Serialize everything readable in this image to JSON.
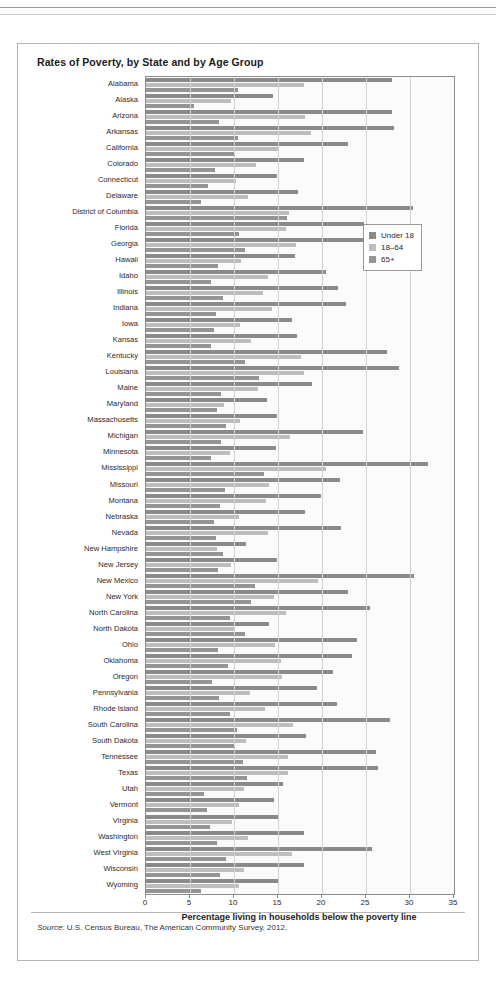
{
  "figure": {
    "title": "Rates of Poverty, by State and by Age Group",
    "source_label": "Source:",
    "source_text": "U.S. Census Bureau, The American Community Survey, 2012."
  },
  "legend": {
    "position": "inside-top-right",
    "items": [
      {
        "label": "Under 18",
        "color": "#8a8a8a"
      },
      {
        "label": "18–64",
        "color": "#bdbdbd"
      },
      {
        "label": "65+",
        "color": "#949494"
      }
    ]
  },
  "chart_data": {
    "type": "bar",
    "orientation": "horizontal",
    "title": "Rates of Poverty, by State and by Age Group",
    "xlabel": "Percentage living in households below the poverty line",
    "ylabel": "",
    "xlim": [
      0,
      35
    ],
    "xticks": [
      0,
      5,
      10,
      15,
      20,
      25,
      30,
      35
    ],
    "grid": "vertical",
    "legend_position": "inside-top-right",
    "categories": [
      "Alabama",
      "Alaska",
      "Arizona",
      "Arkansas",
      "California",
      "Colorado",
      "Connecticut",
      "Delaware",
      "District of Columbia",
      "Florida",
      "Georgia",
      "Hawaii",
      "Idaho",
      "Illinois",
      "Indiana",
      "Iowa",
      "Kansas",
      "Kentucky",
      "Louisiana",
      "Maine",
      "Maryland",
      "Massachusetts",
      "Michigan",
      "Minnesota",
      "Mississippi",
      "Missouri",
      "Montana",
      "Nebraska",
      "Nevada",
      "New Hampshire",
      "New Jersey",
      "New Mexico",
      "New York",
      "North Carolina",
      "North Dakota",
      "Ohio",
      "Oklahoma",
      "Oregon",
      "Pennsylvania",
      "Rhode Island",
      "South Carolina",
      "South Dakota",
      "Tennessee",
      "Texas",
      "Utah",
      "Vermont",
      "Virginia",
      "Washington",
      "West Virginia",
      "Wisconsin",
      "Wyoming"
    ],
    "series": [
      {
        "name": "Under 18",
        "color": "#8a8a8a",
        "values": [
          28.0,
          14.4,
          27.9,
          28.2,
          23.0,
          17.9,
          14.9,
          17.3,
          30.3,
          24.8,
          26.4,
          16.9,
          20.5,
          21.8,
          22.7,
          16.6,
          17.2,
          27.4,
          28.8,
          18.9,
          13.7,
          14.9,
          24.7,
          14.8,
          32.0,
          22.1,
          19.9,
          18.1,
          22.2,
          11.4,
          14.9,
          30.5,
          22.9,
          25.4,
          14.0,
          24.0,
          23.4,
          21.2,
          19.4,
          21.7,
          27.7,
          18.2,
          26.1,
          26.4,
          15.6,
          14.5,
          15.0,
          18.0,
          25.7,
          17.9,
          15.1
        ]
      },
      {
        "name": "18–64",
        "color": "#bdbdbd",
        "values": [
          18.0,
          9.7,
          18.1,
          18.8,
          15.1,
          12.5,
          10.2,
          11.6,
          16.2,
          15.9,
          17.0,
          10.8,
          13.9,
          13.3,
          14.3,
          10.7,
          11.9,
          17.6,
          17.9,
          12.7,
          8.9,
          10.7,
          16.4,
          9.5,
          20.5,
          14.0,
          13.6,
          10.6,
          13.9,
          8.1,
          9.7,
          19.6,
          14.6,
          15.9,
          10.1,
          14.7,
          15.3,
          15.5,
          11.8,
          13.5,
          16.7,
          11.4,
          16.1,
          16.1,
          11.1,
          10.6,
          9.8,
          11.6,
          16.6,
          11.1,
          10.6
        ]
      },
      {
        "name": "65+",
        "color": "#949494",
        "values": [
          10.5,
          5.4,
          8.3,
          10.4,
          10.1,
          7.8,
          7.0,
          6.3,
          16.0,
          10.6,
          11.3,
          8.2,
          7.4,
          8.7,
          8.0,
          7.7,
          7.4,
          11.2,
          12.8,
          8.5,
          8.1,
          9.1,
          8.5,
          7.4,
          13.4,
          9.0,
          8.4,
          7.7,
          8.0,
          8.7,
          8.2,
          12.4,
          11.9,
          9.5,
          11.3,
          8.2,
          9.3,
          7.5,
          8.3,
          9.6,
          10.3,
          10.0,
          11.0,
          11.5,
          6.6,
          6.9,
          7.3,
          8.1,
          9.1,
          8.4,
          6.3
        ]
      }
    ]
  }
}
